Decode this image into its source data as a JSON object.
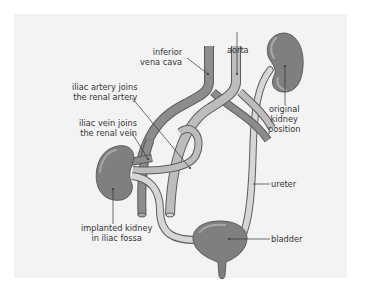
{
  "diagram": {
    "type": "anatomical-illustration",
    "colors": {
      "background": "#f3f3f3",
      "kidney": "#7f7f7f",
      "kidney_highlight": "#a8a8a8",
      "vein": "#8c8c8c",
      "artery": "#bdbdbd",
      "ureter": "#d2d2d2",
      "outline": "#5a5a5a",
      "leader_line": "#333333"
    },
    "labels": {
      "inferior_vena_cava": [
        "inferior",
        "vena cava"
      ],
      "aorta": "aorta",
      "original_kidney": [
        "original",
        "kidney",
        "position"
      ],
      "iliac_artery": [
        "iliac artery joins",
        "the renal artery"
      ],
      "iliac_vein": [
        "iliac vein joins",
        "the renal vein"
      ],
      "ureter": "ureter",
      "implanted_kidney": [
        "implanted kidney",
        "in iliac fossa"
      ],
      "bladder": "bladder"
    }
  }
}
